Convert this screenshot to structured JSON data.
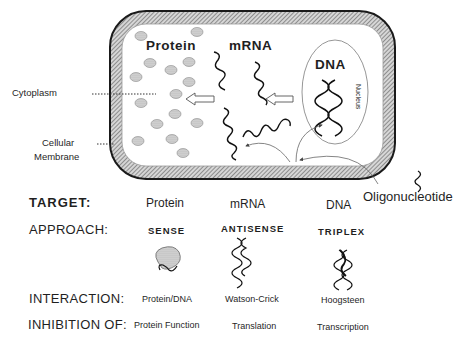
{
  "cell": {
    "labels": {
      "protein": "Protein",
      "mrna": "mRNA",
      "dna": "DNA",
      "nucleus": "Nucleus",
      "cytoplasm": "Cytoplasm",
      "membrane_line1": "Cellular",
      "membrane_line2": "Membrane",
      "oligonucleotide": "Oligonucleotide"
    }
  },
  "table": {
    "rows": [
      {
        "key": "target",
        "label": "TARGET:",
        "values": [
          "Protein",
          "mRNA",
          "DNA"
        ]
      },
      {
        "key": "approach",
        "label": "APPROACH:",
        "values": [
          "SENSE",
          "ANTISENSE",
          "TRIPLEX"
        ]
      },
      {
        "key": "interaction",
        "label": "INTERACTION:",
        "values": [
          "Protein/DNA",
          "Watson-Crick",
          "Hoogsteen"
        ]
      },
      {
        "key": "inhibition",
        "label": "INHIBITION OF:",
        "values": [
          "Protein Function",
          "Translation",
          "Transcription"
        ]
      }
    ],
    "icons": [
      "sense-protein-blob-icon",
      "antisense-double-helix-icon",
      "triplex-triple-helix-icon"
    ]
  },
  "colors": {
    "membrane_hatch": "#8a8a8a",
    "membrane_edge": "#1a1a1a",
    "protein_dot": "#c8c8c8",
    "text": "#1f1f1f"
  }
}
